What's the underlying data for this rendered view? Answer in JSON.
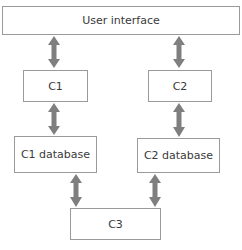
{
  "diagram": {
    "nodes": [
      {
        "id": "ui",
        "label": "User interface"
      },
      {
        "id": "c1",
        "label": "C1"
      },
      {
        "id": "c2",
        "label": "C2"
      },
      {
        "id": "c1db",
        "label": "C1 database"
      },
      {
        "id": "c2db",
        "label": "C2 database"
      },
      {
        "id": "c3",
        "label": "C3"
      }
    ],
    "edges": [
      {
        "from": "ui",
        "to": "c1",
        "type": "bidirectional"
      },
      {
        "from": "ui",
        "to": "c2",
        "type": "bidirectional"
      },
      {
        "from": "c1",
        "to": "c1db",
        "type": "bidirectional"
      },
      {
        "from": "c2",
        "to": "c2db",
        "type": "bidirectional"
      },
      {
        "from": "c1db",
        "to": "c3",
        "type": "bidirectional"
      },
      {
        "from": "c2db",
        "to": "c3",
        "type": "bidirectional"
      }
    ],
    "colors": {
      "border": "#9a9a9a",
      "arrow": "#7f7f7f",
      "text": "#3a3a3a"
    }
  }
}
